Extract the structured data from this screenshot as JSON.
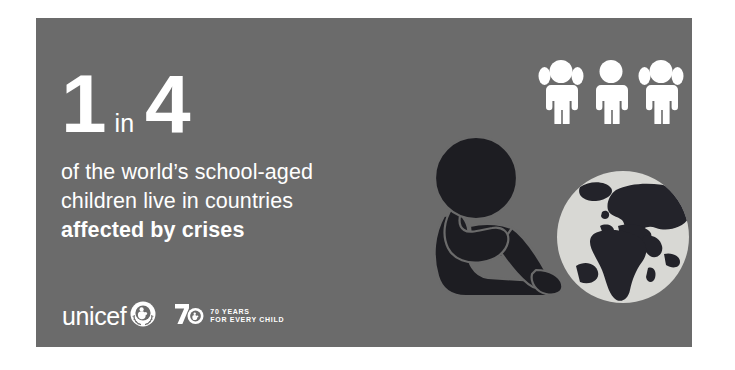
{
  "poster": {
    "background_color": "#6b6b6b",
    "figure_color": "#1d1d22",
    "text_color": "#ffffff",
    "globe_ocean_color": "#d8d8d4",
    "globe_land_color": "#23232a",
    "canvas_color": "#ffffff"
  },
  "statistic": {
    "numerator": "1",
    "connector": "in",
    "denominator": "4"
  },
  "headline": {
    "line1": "of the world’s school-aged",
    "line2": "children live in countries",
    "line3": "affected by crises"
  },
  "logo": {
    "wordmark": "unicef",
    "emblem_name": "un-globe-laurel-emblem",
    "anniversary_mark": "70",
    "anniversary_line1": "70 YEARS",
    "anniversary_line2": "FOR EVERY CHILD"
  },
  "illustration": {
    "children_icons": [
      {
        "name": "child-girl-pigtails-icon"
      },
      {
        "name": "child-plain-icon"
      },
      {
        "name": "child-girl-pigtails-icon"
      }
    ],
    "globe_icon": "globe-europe-africa-asia-icon",
    "seated_child_icon": "seated-child-knees-up-icon"
  }
}
